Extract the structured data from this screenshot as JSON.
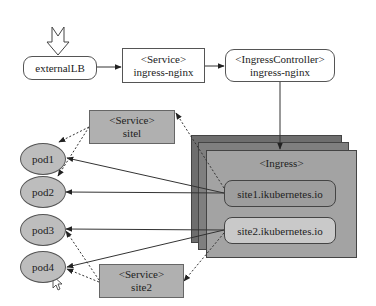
{
  "diagram": {
    "entry_arrow": {
      "icon": "hollow-down-arrow"
    },
    "external_lb": {
      "label": "externalLB"
    },
    "service_ingress": {
      "stereotype": "<Service>",
      "name": "ingress-nginx"
    },
    "ingress_controller": {
      "stereotype": "<IngressController>",
      "name": "ingress-nginx"
    },
    "ingress": {
      "stereotype": "<Ingress>",
      "rules": [
        {
          "host": "site1.ikubernetes.io",
          "fill": "#9d9d9d"
        },
        {
          "host": "site2.ikubernetes.io",
          "fill": "#c9c9c9"
        }
      ],
      "layer_colors": [
        "#6e6e6e",
        "#7f7f7f",
        "#a3a3a3"
      ]
    },
    "services": [
      {
        "stereotype": "<Service>",
        "name": "sitel"
      },
      {
        "stereotype": "<Service>",
        "name": "site2"
      }
    ],
    "pods": [
      {
        "label": "pod1"
      },
      {
        "label": "pod2"
      },
      {
        "label": "pod3"
      },
      {
        "label": "pod4"
      }
    ],
    "edges": [
      {
        "from": "externalLB",
        "to": "Service ingress-nginx",
        "style": "solid"
      },
      {
        "from": "Service ingress-nginx",
        "to": "IngressController",
        "style": "solid"
      },
      {
        "from": "IngressController",
        "to": "Ingress",
        "style": "solid"
      },
      {
        "from": "site1.ikubernetes.io",
        "to": "pod1",
        "style": "solid"
      },
      {
        "from": "site1.ikubernetes.io",
        "to": "pod2",
        "style": "solid"
      },
      {
        "from": "site2.ikubernetes.io",
        "to": "pod3",
        "style": "solid"
      },
      {
        "from": "site2.ikubernetes.io",
        "to": "pod4",
        "style": "solid"
      },
      {
        "from": "site1.ikubernetes.io",
        "to": "Service sitel",
        "style": "dashed"
      },
      {
        "from": "site2.ikubernetes.io",
        "to": "Service site2",
        "style": "dashed"
      },
      {
        "from": "Service sitel",
        "to": "pod1",
        "style": "dashed"
      },
      {
        "from": "Service sitel",
        "to": "pod2",
        "style": "dashed"
      },
      {
        "from": "Service site2",
        "to": "pod3",
        "style": "dashed"
      },
      {
        "from": "Service site2",
        "to": "pod4",
        "style": "dashed"
      }
    ]
  }
}
